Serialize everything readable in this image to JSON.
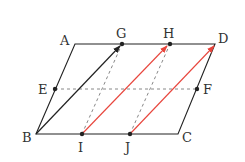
{
  "diagram": {
    "type": "parallelogram-vectors",
    "points": {
      "A": {
        "label": "A",
        "x": 75,
        "y": 44
      },
      "G": {
        "label": "G",
        "x": 122,
        "y": 44
      },
      "H": {
        "label": "H",
        "x": 170,
        "y": 44
      },
      "D": {
        "label": "D",
        "x": 215,
        "y": 44
      },
      "E": {
        "label": "E",
        "x": 55,
        "y": 89
      },
      "F": {
        "label": "F",
        "x": 197,
        "y": 89
      },
      "B": {
        "label": "B",
        "x": 36,
        "y": 134
      },
      "I": {
        "label": "I",
        "x": 82,
        "y": 134
      },
      "J": {
        "label": "J",
        "x": 130,
        "y": 134
      },
      "C": {
        "label": "C",
        "x": 178,
        "y": 134
      }
    },
    "colors": {
      "line": "#222222",
      "dashed": "#888888",
      "red_arrow": "#e8453c"
    },
    "segments": {
      "solid": [
        "AD",
        "DC",
        "CB",
        "BA"
      ],
      "dashed": [
        "EF",
        "IG",
        "JH"
      ],
      "arrows_black": [
        "BG"
      ],
      "arrows_red": [
        "IH",
        "JD"
      ]
    }
  }
}
